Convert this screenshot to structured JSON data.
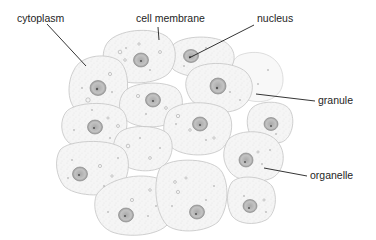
{
  "diagram": {
    "labels": [
      {
        "id": "cytoplasm",
        "text": "cytoplasm",
        "x": 17,
        "y": 13,
        "leader": {
          "x1": 47,
          "y1": 24,
          "x2": 86,
          "y2": 66
        }
      },
      {
        "id": "cell-membrane",
        "text": "cell membrane",
        "x": 136,
        "y": 13,
        "leader": {
          "x1": 158,
          "y1": 27,
          "x2": 159,
          "y2": 40
        }
      },
      {
        "id": "nucleus",
        "text": "nucleus",
        "x": 257,
        "y": 13,
        "leader": {
          "x1": 254,
          "y1": 25,
          "x2": 189,
          "y2": 58
        }
      },
      {
        "id": "granule",
        "text": "granule",
        "x": 318,
        "y": 95,
        "leader": {
          "x1": 256,
          "y1": 94,
          "x2": 315,
          "y2": 101
        }
      },
      {
        "id": "organelle",
        "text": "organelle",
        "x": 310,
        "y": 170,
        "leader": {
          "x1": 264,
          "y1": 168,
          "x2": 307,
          "y2": 176
        }
      }
    ],
    "colors": {
      "background": "#ffffff",
      "cell_fill": "#f4f4f4",
      "cell_outline": "#c8c8c8",
      "nucleus_fill": "#bdbdbd",
      "nucleus_outline": "#8a8a8a",
      "nucleolus": "#555555",
      "leader_line": "#1e1e1e",
      "label_text": "#1e1e1e"
    }
  }
}
